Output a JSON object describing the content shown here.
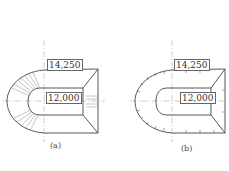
{
  "figures": [
    {
      "id": "a",
      "caption": "(a)",
      "dim_outer": "14,250",
      "dim_inner": "12,000",
      "edge_marks": "radial-hatching"
    },
    {
      "id": "b",
      "caption": "(b)",
      "dim_outer": "14,250",
      "dim_inner": "12,000",
      "edge_marks": "tick-marks"
    }
  ],
  "colors": {
    "line": "#444444",
    "centerline": "#999999",
    "background": "#ffffff"
  }
}
